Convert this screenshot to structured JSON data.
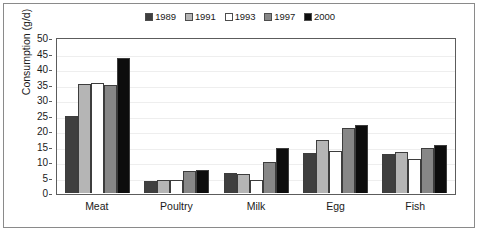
{
  "chart_data": {
    "type": "bar",
    "title": "",
    "subtitle": "",
    "xlabel": "",
    "ylabel": "Consumption (g/d)",
    "categories": [
      "Meat",
      "Poultry",
      "Milk",
      "Egg",
      "Fish"
    ],
    "series": [
      {
        "name": "1989",
        "color": "#3f3f3f",
        "values": [
          24.9,
          4.0,
          6.4,
          13.0,
          12.5
        ]
      },
      {
        "name": "1991",
        "color": "#b5b5b5",
        "values": [
          35.1,
          4.2,
          6.0,
          17.1,
          13.1
        ]
      },
      {
        "name": "1993",
        "color": "#ffffff",
        "values": [
          35.5,
          4.3,
          4.3,
          13.5,
          11.0
        ]
      },
      {
        "name": "1997",
        "color": "#878787",
        "values": [
          34.9,
          7.0,
          9.9,
          21.1,
          14.4
        ]
      },
      {
        "name": "2000",
        "color": "#0d0d0d",
        "values": [
          43.4,
          7.3,
          14.5,
          21.8,
          15.6
        ]
      }
    ],
    "ylim": [
      0,
      50
    ],
    "ytick_step": 5,
    "yticks": [
      "0",
      "5",
      "10",
      "15",
      "20",
      "25",
      "30",
      "35",
      "40",
      "45",
      "50"
    ],
    "grid": true,
    "grid_axis": "y",
    "legend_position": "top-center",
    "legend_entries": [
      "1989",
      "1991",
      "1993",
      "1997",
      "2000"
    ]
  },
  "figure": {
    "border_color": "#8a8a8a",
    "axis_color": "#5c5c5c",
    "background": "#ffffff"
  }
}
